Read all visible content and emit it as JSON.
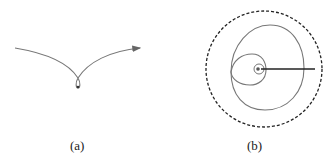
{
  "panels": [
    {
      "id": "a",
      "label": "(a)",
      "description": "trajectory curve with small loop and arrowhead"
    },
    {
      "id": "b",
      "label": "(b)",
      "description": "nested loops spiral inside dashed boundary circle with radius line"
    }
  ],
  "colors": {
    "curve": "#777777",
    "boundary": "#222222",
    "radius_line": "#222222"
  }
}
